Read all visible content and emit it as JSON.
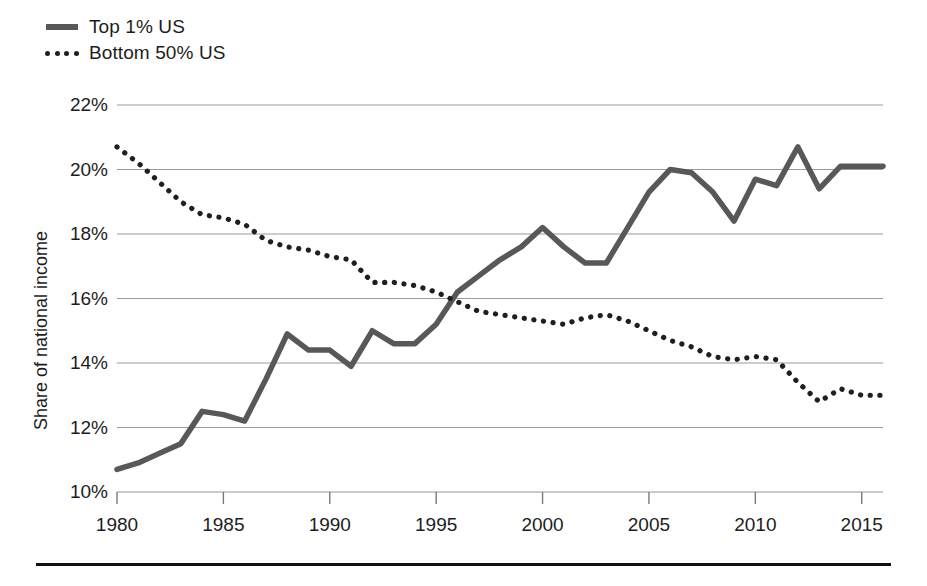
{
  "legend": {
    "position": "top-left",
    "items": [
      {
        "label": "Top 1% US",
        "style": "solid",
        "color": "#585858",
        "icon": "solid-line-swatch"
      },
      {
        "label": "Bottom 50% US",
        "style": "dotted",
        "color": "#1f1f1f",
        "icon": "dotted-line-swatch"
      }
    ]
  },
  "axes": {
    "ylabel": "Share of national income",
    "yticks": [
      "10%",
      "12%",
      "14%",
      "16%",
      "18%",
      "20%",
      "22%"
    ],
    "xticks": [
      "1980",
      "1985",
      "1990",
      "1995",
      "2000",
      "2005",
      "2010",
      "2015"
    ]
  },
  "chart_data": {
    "type": "line",
    "title": "",
    "subtitle": "",
    "xlabel": "",
    "ylabel": "Share of national income",
    "xlim": [
      1980,
      2016
    ],
    "ylim": [
      10,
      22
    ],
    "ytick_values": [
      10,
      12,
      14,
      16,
      18,
      20,
      22
    ],
    "ytick_labels": [
      "10%",
      "12%",
      "14%",
      "16%",
      "18%",
      "20%",
      "22%"
    ],
    "xtick_values": [
      1980,
      1985,
      1990,
      1995,
      2000,
      2005,
      2010,
      2015
    ],
    "xtick_labels": [
      "1980",
      "1985",
      "1990",
      "1995",
      "2000",
      "2005",
      "2010",
      "2015"
    ],
    "grid": "horizontal",
    "legend_position": "above-plot-left",
    "x": [
      1980,
      1981,
      1982,
      1983,
      1984,
      1985,
      1986,
      1987,
      1988,
      1989,
      1990,
      1991,
      1992,
      1993,
      1994,
      1995,
      1996,
      1997,
      1998,
      1999,
      2000,
      2001,
      2002,
      2003,
      2004,
      2005,
      2006,
      2007,
      2008,
      2009,
      2010,
      2011,
      2012,
      2013,
      2014,
      2015,
      2016
    ],
    "series": [
      {
        "name": "Top 1% US",
        "style": "solid",
        "color": "#585858",
        "values": [
          10.7,
          10.9,
          11.2,
          11.5,
          12.5,
          12.4,
          12.2,
          13.5,
          14.9,
          14.4,
          14.4,
          13.9,
          15.0,
          14.6,
          14.6,
          15.2,
          16.2,
          16.7,
          17.2,
          17.6,
          18.2,
          17.6,
          17.1,
          17.1,
          18.2,
          19.3,
          20.0,
          19.9,
          19.3,
          18.4,
          19.7,
          19.5,
          20.7,
          19.4,
          20.1,
          20.1,
          20.1
        ]
      },
      {
        "name": "Bottom 50% US",
        "style": "dotted",
        "color": "#1f1f1f",
        "values": [
          20.7,
          20.2,
          19.6,
          19.0,
          18.6,
          18.5,
          18.3,
          17.8,
          17.6,
          17.5,
          17.3,
          17.2,
          16.5,
          16.5,
          16.4,
          16.2,
          15.9,
          15.6,
          15.5,
          15.4,
          15.3,
          15.2,
          15.4,
          15.5,
          15.3,
          15.0,
          14.7,
          14.5,
          14.2,
          14.1,
          14.2,
          14.1,
          13.4,
          12.8,
          13.2,
          13.0,
          13.0
        ]
      }
    ]
  }
}
